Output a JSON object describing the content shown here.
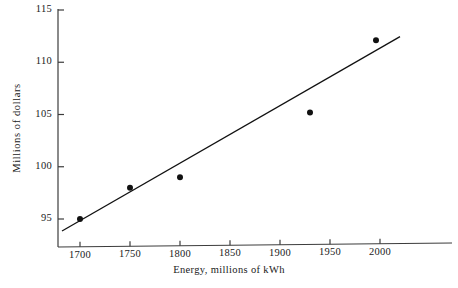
{
  "chart_data": {
    "type": "scatter",
    "title": "",
    "xlabel": "Energy, millions of kWh",
    "ylabel": "Millions of dollars",
    "xlim": [
      1682,
      1430
    ],
    "x_axis": {
      "min": 1682,
      "max": 2030,
      "ticks": [
        1700,
        1750,
        1800,
        1850,
        1900,
        1950,
        2000
      ],
      "tick_labels": [
        "1700",
        "1750",
        "1800",
        "1850",
        "1900",
        "1950",
        "2000"
      ]
    },
    "y_axis": {
      "min": 93.0,
      "max": 115.0,
      "ticks": [
        95,
        100,
        105,
        110,
        115
      ],
      "tick_labels": [
        "95",
        "100",
        "105",
        "110",
        "115"
      ]
    },
    "grid": false,
    "legend": false,
    "points": [
      {
        "x": 1700,
        "y": 95.0
      },
      {
        "x": 1750,
        "y": 98.0
      },
      {
        "x": 1800,
        "y": 99.0
      },
      {
        "x": 1930,
        "y": 105.2
      },
      {
        "x": 1996,
        "y": 112.1
      }
    ],
    "series": [
      {
        "name": "observations",
        "type": "scatter",
        "x": [
          1700,
          1750,
          1800,
          1930,
          1996
        ],
        "values": [
          95.0,
          98.0,
          99.0,
          105.2,
          112.1
        ]
      },
      {
        "name": "fitted-line",
        "type": "line",
        "x": [
          1682,
          2020
        ],
        "values": [
          93.85,
          112.45
        ]
      }
    ],
    "fit_line": {
      "x_start": 1682,
      "y_start": 93.85,
      "x_end": 2020,
      "y_end": 112.45
    },
    "colors": {
      "background": "#ffffff",
      "axis": "#3c3c3c",
      "marker": "#111111",
      "line": "#111111",
      "text": "#1a1a1a"
    }
  }
}
